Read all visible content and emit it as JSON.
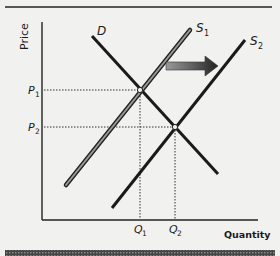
{
  "diagram": {
    "y_axis_label": "Price",
    "x_axis_label": "Quantity",
    "curves": {
      "demand": {
        "label": "D"
      },
      "supply1": {
        "label": "S",
        "sub": "1"
      },
      "supply2": {
        "label": "S",
        "sub": "2"
      }
    },
    "price_labels": [
      {
        "label": "P",
        "sub": "1"
      },
      {
        "label": "P",
        "sub": "2"
      }
    ],
    "quantity_labels": [
      {
        "label": "Q",
        "sub": "1"
      },
      {
        "label": "Q",
        "sub": "2"
      }
    ],
    "shift_arrow": {
      "direction": "right"
    },
    "colors": {
      "line": "#1a1a1a",
      "supply1_fill": "#8a8a8a",
      "background": "#f1f1ef"
    }
  }
}
